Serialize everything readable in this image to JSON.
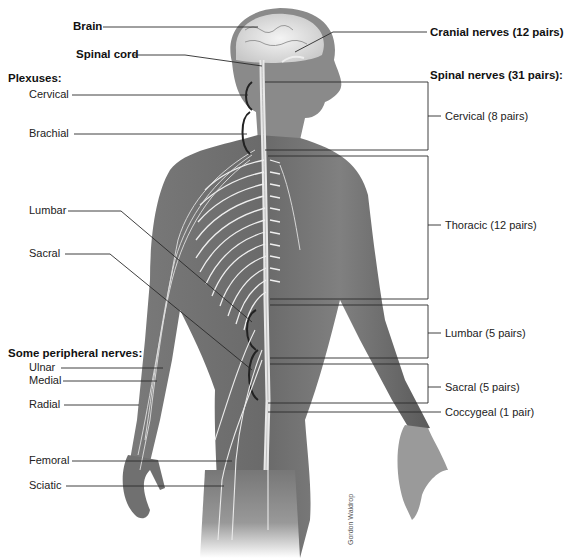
{
  "figure": {
    "credit": "Gordon Waldrop",
    "colors": {
      "skin_dark": "#5e5e5e",
      "skin_mid": "#8a8a8a",
      "skin_light": "#b8b8b8",
      "nerve": "#f2f2f2",
      "leader_line": "#2a2a2a",
      "background": "#ffffff"
    }
  },
  "left_labels": {
    "brain": "Brain",
    "spinal_cord": "Spinal cord",
    "plexuses_heading": "Plexuses:",
    "plexuses": [
      {
        "id": "cervical",
        "label": "Cervical"
      },
      {
        "id": "brachial",
        "label": "Brachial"
      },
      {
        "id": "lumbar",
        "label": "Lumbar"
      },
      {
        "id": "sacral",
        "label": "Sacral"
      }
    ],
    "peripheral_heading": "Some peripheral nerves:",
    "peripheral": [
      {
        "id": "ulnar",
        "label": "Ulnar"
      },
      {
        "id": "medial",
        "label": "Medial"
      },
      {
        "id": "radial",
        "label": "Radial"
      },
      {
        "id": "femoral",
        "label": "Femoral"
      },
      {
        "id": "sciatic",
        "label": "Sciatic"
      }
    ]
  },
  "right_labels": {
    "cranial": "Cranial nerves (12 pairs)",
    "spinal_heading": "Spinal nerves (31 pairs):",
    "spinal_groups": [
      {
        "id": "cervical",
        "label": "Cervical (8 pairs)"
      },
      {
        "id": "thoracic",
        "label": "Thoracic (12 pairs)"
      },
      {
        "id": "lumbar",
        "label": "Lumbar (5 pairs)"
      },
      {
        "id": "sacral",
        "label": "Sacral (5 pairs)"
      },
      {
        "id": "coccygeal",
        "label": "Coccygeal (1 pair)"
      }
    ]
  }
}
